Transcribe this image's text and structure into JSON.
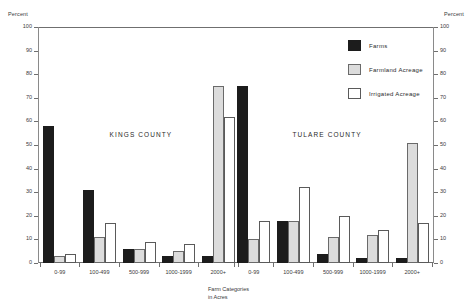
{
  "axis": {
    "unit_label_left": "Percent",
    "unit_label_right": "Percent",
    "y_ticks": [
      "100",
      "90",
      "80",
      "70",
      "60",
      "50",
      "40",
      "30",
      "20",
      "10",
      "0"
    ],
    "x_caption_line1": "Farm Categories",
    "x_caption_line2": "in Acres"
  },
  "legend": {
    "items": [
      {
        "label": "Farms",
        "swatch": "black"
      },
      {
        "label": "Farmland Acreage",
        "swatch": "light-gray"
      },
      {
        "label": "Irrigated Acreage",
        "swatch": "white"
      }
    ]
  },
  "annotations": {
    "county_left": "KINGS COUNTY",
    "county_right": "TULARE COUNTY"
  },
  "colors": {
    "farms": "#1c1c1c",
    "farmland": "#dcdcdc",
    "irrigated": "#ffffff",
    "axis": "#6f6f6f"
  },
  "chart_data": {
    "type": "bar",
    "title": "",
    "xlabel": "Farm Categories in Acres",
    "ylabel": "Percent",
    "ylim": [
      0,
      100
    ],
    "ytick_step": 10,
    "grid": false,
    "legend_position": "top-right",
    "panels": [
      "KINGS COUNTY",
      "TULARE COUNTY"
    ],
    "categories": [
      "0-99",
      "100-499",
      "500-999",
      "1000-1999",
      "2000+"
    ],
    "groups": [
      {
        "panel": "KINGS COUNTY",
        "series": [
          {
            "name": "Farms",
            "values": [
              58,
              31,
              6,
              3,
              3
            ]
          },
          {
            "name": "Farmland Acreage",
            "values": [
              3,
              11,
              6,
              5,
              75
            ]
          },
          {
            "name": "Irrigated Acreage",
            "values": [
              4,
              17,
              9,
              8,
              62
            ]
          }
        ]
      },
      {
        "panel": "TULARE COUNTY",
        "series": [
          {
            "name": "Farms",
            "values": [
              75,
              18,
              4,
              2,
              2
            ]
          },
          {
            "name": "Farmland Acreage",
            "values": [
              10,
              18,
              11,
              12,
              51
            ]
          },
          {
            "name": "Irrigated Acreage",
            "values": [
              18,
              32,
              20,
              14,
              17
            ]
          }
        ]
      }
    ]
  }
}
